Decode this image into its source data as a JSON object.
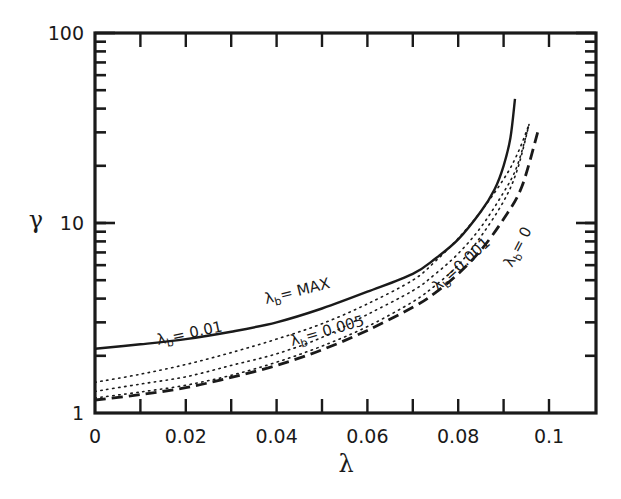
{
  "chart_data": {
    "type": "line",
    "title": "",
    "xlabel": "λ",
    "ylabel": "γ",
    "xlim": [
      0,
      0.111
    ],
    "ylim": [
      1,
      100
    ],
    "yscale": "log",
    "grid": false,
    "legend": "inline curve labels",
    "x_ticks": [
      0,
      0.02,
      0.04,
      0.06,
      0.08,
      0.1
    ],
    "x_tick_labels": [
      "0",
      "0.02",
      "0.04",
      "0.06",
      "0.08",
      "0.1"
    ],
    "x_minor_ticks": [
      0.01,
      0.03,
      0.05,
      0.07,
      0.09
    ],
    "y_ticks": [
      1,
      10,
      100
    ],
    "y_tick_labels": [
      "1",
      "10",
      "100"
    ],
    "series": [
      {
        "name": "λb = MAX",
        "label_main": "λ",
        "label_sub": "b",
        "label_rest": "= MAX",
        "style": "solid",
        "x": [
          0,
          0.01,
          0.02,
          0.03,
          0.04,
          0.05,
          0.06,
          0.07,
          0.075,
          0.08,
          0.085,
          0.088,
          0.09,
          0.0915,
          0.0925
        ],
        "y": [
          2.18,
          2.3,
          2.45,
          2.68,
          3.0,
          3.55,
          4.35,
          5.4,
          6.5,
          8.2,
          11.5,
          15,
          20,
          28,
          45
        ]
      },
      {
        "name": "λb = 0.01",
        "label_main": "λ",
        "label_sub": "b",
        "label_rest": "= 0.01",
        "style": "dotted",
        "x": [
          0,
          0.01,
          0.02,
          0.03,
          0.04,
          0.05,
          0.06,
          0.07,
          0.075,
          0.08,
          0.085,
          0.09,
          0.093,
          0.0956
        ],
        "y": [
          1.45,
          1.6,
          1.8,
          2.08,
          2.45,
          2.95,
          3.75,
          5.0,
          6.3,
          8.3,
          11.5,
          17,
          23,
          33
        ]
      },
      {
        "name": "λb = 0.005",
        "label_main": "λ",
        "label_sub": "b",
        "label_rest": "= 0.005",
        "style": "dotted",
        "x": [
          0,
          0.01,
          0.02,
          0.03,
          0.04,
          0.05,
          0.06,
          0.07,
          0.075,
          0.08,
          0.085,
          0.09,
          0.093,
          0.0956
        ],
        "y": [
          1.3,
          1.42,
          1.55,
          1.78,
          2.05,
          2.5,
          3.3,
          4.4,
          5.4,
          6.9,
          9.5,
          14.5,
          20,
          33
        ]
      },
      {
        "name": "λb = 0.001",
        "label_main": "λ",
        "label_sub": "b",
        "label_rest": "=0.001",
        "style": "dotted",
        "x": [
          0,
          0.01,
          0.02,
          0.03,
          0.04,
          0.05,
          0.06,
          0.07,
          0.075,
          0.08,
          0.085,
          0.09,
          0.093,
          0.0956
        ],
        "y": [
          1.2,
          1.29,
          1.4,
          1.58,
          1.85,
          2.25,
          2.85,
          3.85,
          4.7,
          6.0,
          8.5,
          13,
          19,
          33
        ]
      },
      {
        "name": "λb = 0",
        "label_main": "λ",
        "label_sub": "b",
        "label_rest": "= 0",
        "style": "dashed",
        "x": [
          0,
          0.01,
          0.02,
          0.03,
          0.04,
          0.05,
          0.06,
          0.07,
          0.075,
          0.08,
          0.085,
          0.09,
          0.094,
          0.0976
        ],
        "y": [
          1.17,
          1.25,
          1.36,
          1.54,
          1.78,
          2.15,
          2.72,
          3.6,
          4.3,
          5.4,
          7.2,
          10.5,
          15.5,
          30.6
        ]
      }
    ]
  },
  "axes": {
    "x_label": "λ",
    "y_label": "γ"
  },
  "curve_labels": [
    {
      "main": "λ",
      "sub": "b",
      "rest": "= MAX"
    },
    {
      "main": "λ",
      "sub": "b",
      "rest": "= 0.01"
    },
    {
      "main": "λ",
      "sub": "b",
      "rest": "= 0.005"
    },
    {
      "main": "λ",
      "sub": "b",
      "rest": "=0.001"
    },
    {
      "main": "λ",
      "sub": "b",
      "rest": "= 0"
    }
  ]
}
